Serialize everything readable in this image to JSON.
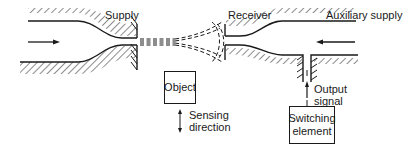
{
  "diagram": {
    "labels": {
      "supply": "Supply",
      "receiver": "Receiver",
      "auxiliary_supply": "Auxiliary supply",
      "sensing_direction_line1": "Sensing",
      "sensing_direction_line2": "direction",
      "output_signal_line1": "Output",
      "output_signal_line2": "signal"
    },
    "boxes": {
      "object": "Object",
      "switching_element_line1": "Switching",
      "switching_element_line2": "element"
    },
    "colors": {
      "stroke": "#1a1a1a",
      "background": "#ffffff"
    }
  }
}
